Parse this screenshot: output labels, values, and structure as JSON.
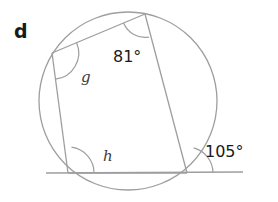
{
  "figure": {
    "part_label": "d",
    "type": "cyclic-quadrilateral-with-tangent",
    "stroke_color": "#9a9a9a",
    "text_color": "#1a1a1a",
    "background": "#ffffff",
    "circle": {
      "cx": 128,
      "cy": 101,
      "r": 89
    },
    "vertices": {
      "top": {
        "x": 145,
        "y": 14,
        "name": "top-vertex"
      },
      "left": {
        "x": 52,
        "y": 53,
        "name": "left-vertex"
      },
      "bottom_left": {
        "x": 68,
        "y": 173,
        "name": "bottom-left-vertex"
      },
      "bottom_right": {
        "x": 187,
        "y": 173,
        "name": "bottom-right-vertex"
      }
    },
    "tangent_line": {
      "x1": 46,
      "y1": 173,
      "x2": 243,
      "y2": 172
    },
    "labels": [
      {
        "id": "angle-81",
        "text": "81°",
        "x": 113,
        "y": 62,
        "kind": "value"
      },
      {
        "id": "angle-g",
        "text": "g",
        "x": 81,
        "y": 82,
        "kind": "variable"
      },
      {
        "id": "angle-h",
        "text": "h",
        "x": 103,
        "y": 161,
        "kind": "variable"
      },
      {
        "id": "angle-105",
        "text": "105°",
        "x": 205,
        "y": 157,
        "kind": "value"
      }
    ]
  }
}
